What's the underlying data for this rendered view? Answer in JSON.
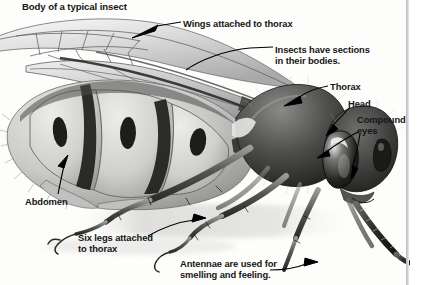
{
  "diagram": {
    "title": "Body of a typical insect",
    "style": "pencil-drawing-grayscale",
    "background_color": "#fdfdfc",
    "text_color": "#151515",
    "labels": [
      {
        "id": "title",
        "text": "Body of a typical insect",
        "has_leader": false
      },
      {
        "id": "wings",
        "text": "Wings attached to thorax",
        "has_leader": true,
        "leader": "arrow-left"
      },
      {
        "id": "sections",
        "text": "Insects have sections\nin their bodies.",
        "has_leader": true,
        "leader": "line-left"
      },
      {
        "id": "thorax",
        "text": "Thorax",
        "has_leader": true,
        "leader": "arrow-left"
      },
      {
        "id": "head",
        "text": "Head",
        "has_leader": true,
        "leader": "arrow-down-left"
      },
      {
        "id": "eyes",
        "text": "Compound\neyes",
        "has_leader": true,
        "leader": "arrow-pair-left"
      },
      {
        "id": "abdomen",
        "text": "Abdomen",
        "has_leader": true,
        "leader": "arrow-up"
      },
      {
        "id": "sixlegs",
        "text": "Six legs attached\nto thorax",
        "has_leader": true,
        "leader": "arrow-right-curve"
      },
      {
        "id": "antennae",
        "text": "Antennae are used for\nsmelling and feeling.",
        "has_leader": true,
        "leader": "arrow-right"
      }
    ],
    "anatomy_parts": [
      "wings",
      "thorax",
      "head",
      "compound eyes",
      "abdomen",
      "legs",
      "antennae"
    ],
    "right_margin_rule": "#b9b9b9"
  }
}
